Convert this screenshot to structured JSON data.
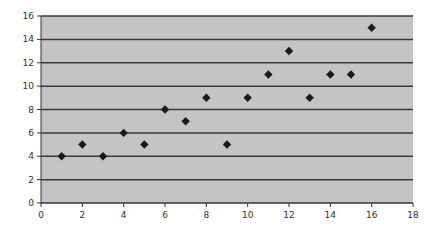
{
  "chart_data": {
    "type": "scatter",
    "title": "",
    "xlabel": "",
    "ylabel": "",
    "xlim": [
      0,
      18
    ],
    "ylim": [
      0,
      16
    ],
    "x_ticks": [
      0,
      2,
      4,
      6,
      8,
      10,
      12,
      14,
      16,
      18
    ],
    "y_ticks": [
      0,
      2,
      4,
      6,
      8,
      10,
      12,
      14,
      16
    ],
    "grid": {
      "horizontal": true,
      "vertical": false
    },
    "legend": null,
    "marker": "diamond",
    "series": [
      {
        "name": "Series 1",
        "points": [
          {
            "x": 1,
            "y": 4
          },
          {
            "x": 2,
            "y": 5
          },
          {
            "x": 3,
            "y": 4
          },
          {
            "x": 4,
            "y": 6
          },
          {
            "x": 5,
            "y": 5
          },
          {
            "x": 6,
            "y": 8
          },
          {
            "x": 7,
            "y": 7
          },
          {
            "x": 8,
            "y": 9
          },
          {
            "x": 9,
            "y": 5
          },
          {
            "x": 10,
            "y": 9
          },
          {
            "x": 11,
            "y": 11
          },
          {
            "x": 12,
            "y": 13
          },
          {
            "x": 13,
            "y": 9
          },
          {
            "x": 14,
            "y": 11
          },
          {
            "x": 15,
            "y": 11
          },
          {
            "x": 16,
            "y": 15
          }
        ]
      }
    ]
  },
  "colors": {
    "plot_background": "#c4c4c4",
    "gridline": "#3a3a3a",
    "marker": "#1a1a1a",
    "axis": "#333333",
    "tick_label": "#333333"
  }
}
